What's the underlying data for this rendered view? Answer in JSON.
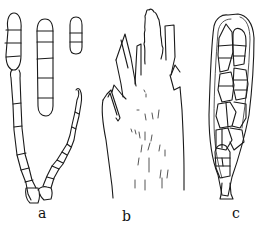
{
  "figure": {
    "panels": [
      {
        "id": "a",
        "label": "a",
        "description": "three septate spores and a germinating septate hyphal chain"
      },
      {
        "id": "b",
        "label": "b",
        "description": "fringed apical structure with lacerate lobes"
      },
      {
        "id": "c",
        "label": "c",
        "description": "ascus containing muriform spores"
      }
    ],
    "colors": {
      "ink": "#1a1a1a",
      "paper": "#ffffff"
    }
  }
}
